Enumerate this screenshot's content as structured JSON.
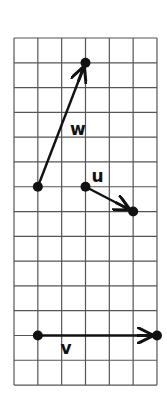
{
  "grid": {
    "columns": 6,
    "rows": 14,
    "origin_px": [
      14,
      38
    ],
    "cell_w": 23.83,
    "cell_h": 24.79,
    "line_color": "#555555",
    "ink_color": "#111111"
  },
  "vectors": [
    {
      "name": "w",
      "label": "w",
      "start": [
        1,
        6
      ],
      "end": [
        3,
        1
      ],
      "label_pos": [
        2.35,
        3.9
      ]
    },
    {
      "name": "u",
      "label": "u",
      "start": [
        3,
        6
      ],
      "end": [
        5,
        7
      ],
      "label_pos": [
        3.25,
        5.8
      ]
    },
    {
      "name": "v",
      "label": "v",
      "start": [
        1,
        12
      ],
      "end": [
        6,
        12
      ],
      "label_pos": [
        1.95,
        12.75
      ]
    }
  ]
}
